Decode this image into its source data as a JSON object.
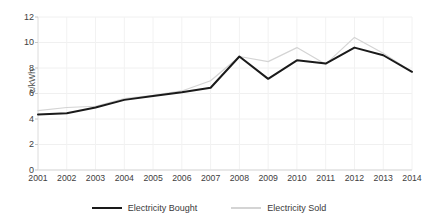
{
  "chart_data": {
    "type": "line",
    "title": "",
    "xlabel": "",
    "ylabel": "c/kWh",
    "categories": [
      "2001",
      "2002",
      "2003",
      "2004",
      "2005",
      "2006",
      "2007",
      "2008",
      "2009",
      "2010",
      "2011",
      "2012",
      "2013",
      "2014"
    ],
    "x": [
      2001,
      2002,
      2003,
      2004,
      2005,
      2006,
      2007,
      2008,
      2009,
      2010,
      2011,
      2012,
      2013,
      2014
    ],
    "ylim": [
      0,
      12
    ],
    "yticks": [
      0,
      2,
      4,
      6,
      8,
      10,
      12
    ],
    "ytick_labels": [
      "0",
      "2",
      "4",
      "6",
      "8",
      "10",
      "12"
    ],
    "grid": "light vertical and horizontal gridlines",
    "legend_position": "bottom-center",
    "series": [
      {
        "name": "Electricity Bought",
        "color": "#1a1a1a",
        "line_width": 2.0,
        "values": [
          4.35,
          4.45,
          4.9,
          5.5,
          5.8,
          6.1,
          6.45,
          8.9,
          7.15,
          8.6,
          8.35,
          9.6,
          9.0,
          7.7
        ]
      },
      {
        "name": "Electricity Sold",
        "color": "#d4d4d4",
        "line_width": 1.2,
        "values": [
          4.65,
          4.9,
          5.0,
          5.6,
          5.85,
          6.2,
          7.0,
          8.9,
          8.5,
          9.6,
          8.3,
          10.4,
          9.15,
          7.7
        ]
      }
    ]
  },
  "legend": {
    "items": [
      {
        "label": "Electricity Bought",
        "color": "#1a1a1a",
        "width": "2px"
      },
      {
        "label": "Electricity Sold",
        "color": "#d4d4d4",
        "width": "2px"
      }
    ]
  },
  "axes": {
    "y_title": "c/kWh"
  }
}
